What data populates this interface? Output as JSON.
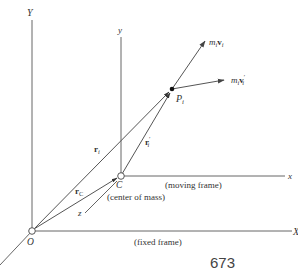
{
  "diagram": {
    "fixed_frame": {
      "origin_label": "O",
      "y_axis_label": "Y",
      "x_axis_label": "X",
      "frame_label": "(fixed frame)"
    },
    "moving_frame": {
      "origin_label": "C",
      "y_axis_label": "y",
      "x_axis_label": "x",
      "z_axis_label": "z",
      "frame_label": "(moving frame)",
      "center_label": "(center of mass)"
    },
    "particle": {
      "label_main": "P",
      "label_sub": "i"
    },
    "vectors": {
      "r_i": {
        "main": "r",
        "sub": "i"
      },
      "r_C": {
        "main": "r",
        "sub": "C"
      },
      "r_i_prime": {
        "main": "r",
        "sub": "i",
        "prime": "′"
      },
      "momentum": {
        "m": "m",
        "m_sub": "i",
        "v": "v",
        "v_sub": "i"
      },
      "momentum_relative": {
        "m": "m",
        "m_sub": "i",
        "v": "v",
        "v_sub": "i",
        "prime": "′"
      }
    },
    "colors": {
      "line": "#555555",
      "text": "#333333",
      "point_fill": "#ffffff",
      "particle_fill": "#111111"
    }
  },
  "page": {
    "number": "673"
  }
}
